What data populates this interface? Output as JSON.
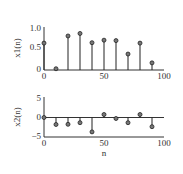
{
  "chart_data": [
    {
      "type": "stem",
      "title": "",
      "xlabel": "",
      "ylabel": "x1(n)",
      "x": [
        0,
        10,
        20,
        30,
        40,
        50,
        60,
        70,
        80,
        90
      ],
      "values": [
        0.64,
        0.03,
        0.81,
        0.87,
        0.65,
        0.71,
        0.7,
        0.38,
        0.64,
        0.17
      ],
      "xlim": [
        0,
        100
      ],
      "ylim": [
        0,
        1.0
      ],
      "xticks": [
        "0",
        "50",
        "100"
      ],
      "yticks": [
        "0",
        "0.5",
        "1.0"
      ],
      "grid": false
    },
    {
      "type": "stem",
      "title": "",
      "xlabel": "n",
      "ylabel": "x2(n)",
      "x": [
        0,
        10,
        20,
        30,
        40,
        50,
        60,
        70,
        80,
        90
      ],
      "values": [
        0.0,
        -1.75,
        -1.7,
        -1.3,
        -3.6,
        0.75,
        -0.25,
        -1.3,
        0.75,
        -2.3
      ],
      "xlim": [
        0,
        100
      ],
      "ylim": [
        -5,
        5
      ],
      "xticks": [
        "0",
        "50",
        "100"
      ],
      "yticks": [
        "-5",
        "0",
        "5"
      ],
      "grid": false
    }
  ],
  "plots": {
    "top": {
      "ylabel": "x1(n)",
      "yticks": [
        "1.0",
        "0.5",
        "0"
      ],
      "xticks": [
        "0",
        "50",
        "100"
      ]
    },
    "bottom": {
      "ylabel": "x2(n)",
      "yticks": [
        "5",
        "0",
        "−5"
      ],
      "xticks": [
        "0",
        "50",
        "100"
      ],
      "xlabel": "n"
    }
  }
}
